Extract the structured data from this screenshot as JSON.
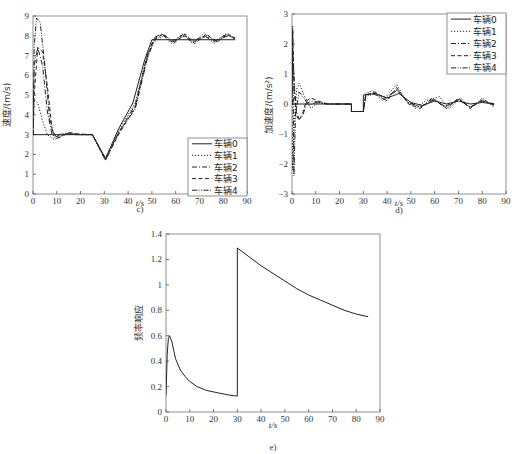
{
  "chart_data": [
    {
      "id": "c",
      "type": "line",
      "caption": "c)",
      "title": "",
      "xlabel": "t/s",
      "ylabel": "速度/(m/s)",
      "xlim": [
        0,
        90
      ],
      "ylim": [
        0,
        9
      ],
      "xticks": [
        0,
        10,
        20,
        30,
        40,
        50,
        60,
        70,
        80,
        90
      ],
      "yticks": [
        0,
        1,
        2,
        3,
        4,
        5,
        6,
        7,
        8,
        9
      ],
      "grid": false,
      "legend_position": "lower right",
      "legend": [
        "车辆0",
        "车辆1",
        "车辆2",
        "车辆3",
        "车辆4"
      ],
      "series": [
        {
          "name": "车辆0",
          "style": "solid",
          "points": [
            [
              0,
              3
            ],
            [
              25,
              3
            ],
            [
              30.5,
              1.8
            ],
            [
              36,
              3.3
            ],
            [
              42,
              4.6
            ],
            [
              47,
              6.8
            ],
            [
              50,
              7.8
            ],
            [
              85,
              7.8
            ]
          ]
        },
        {
          "name": "车辆1",
          "style": "dotted",
          "points": [
            [
              0,
              3
            ],
            [
              0.5,
              4.8
            ],
            [
              2,
              4.6
            ],
            [
              4,
              3.7
            ],
            [
              6,
              3.0
            ],
            [
              9,
              2.75
            ],
            [
              12,
              2.95
            ],
            [
              16,
              3.05
            ],
            [
              20,
              3
            ],
            [
              25,
              3
            ],
            [
              30.5,
              1.75
            ],
            [
              36,
              3.2
            ],
            [
              43,
              4.6
            ],
            [
              48,
              7.0
            ],
            [
              51,
              7.7
            ],
            [
              55,
              8.0
            ],
            [
              58,
              7.6
            ],
            [
              63,
              8.1
            ],
            [
              67,
              7.6
            ],
            [
              72,
              8.15
            ],
            [
              76,
              7.6
            ],
            [
              81,
              8.1
            ],
            [
              85,
              7.8
            ]
          ]
        },
        {
          "name": "车辆2",
          "style": "dashdot",
          "points": [
            [
              0,
              3
            ],
            [
              0.5,
              6.5
            ],
            [
              2,
              7.4
            ],
            [
              4,
              6.5
            ],
            [
              6,
              4.2
            ],
            [
              8,
              3.0
            ],
            [
              11,
              2.85
            ],
            [
              14,
              3.05
            ],
            [
              18,
              3
            ],
            [
              25,
              3
            ],
            [
              30.5,
              1.7
            ],
            [
              36,
              3.1
            ],
            [
              43,
              4.5
            ],
            [
              48,
              7.0
            ],
            [
              51,
              7.9
            ],
            [
              54,
              8.1
            ],
            [
              58,
              7.7
            ],
            [
              63,
              8.05
            ],
            [
              67,
              7.7
            ],
            [
              72,
              8.0
            ],
            [
              76,
              7.7
            ],
            [
              81,
              8.05
            ],
            [
              85,
              7.9
            ]
          ]
        },
        {
          "name": "车辆3",
          "style": "dashed",
          "points": [
            [
              0,
              3
            ],
            [
              0.5,
              5.0
            ],
            [
              2,
              7.4
            ],
            [
              4,
              7.2
            ],
            [
              6,
              5.5
            ],
            [
              8,
              3.3
            ],
            [
              10,
              2.8
            ],
            [
              13,
              3.0
            ],
            [
              17,
              3.05
            ],
            [
              25,
              3
            ],
            [
              30.5,
              1.75
            ],
            [
              36,
              3.0
            ],
            [
              43,
              4.4
            ],
            [
              48,
              6.9
            ],
            [
              51,
              7.85
            ],
            [
              55,
              8.1
            ],
            [
              59,
              7.6
            ],
            [
              64,
              8.1
            ],
            [
              68,
              7.6
            ],
            [
              73,
              8.1
            ],
            [
              77,
              7.65
            ],
            [
              82,
              8.1
            ],
            [
              85,
              7.85
            ]
          ]
        },
        {
          "name": "车辆4",
          "style": "dashdotdot",
          "points": [
            [
              0,
              3
            ],
            [
              0.5,
              7.5
            ],
            [
              1.5,
              8.9
            ],
            [
              3,
              8.7
            ],
            [
              5,
              6.5
            ],
            [
              7,
              3.8
            ],
            [
              9,
              2.85
            ],
            [
              12,
              3.05
            ],
            [
              16,
              3.1
            ],
            [
              20,
              3
            ],
            [
              25,
              3
            ],
            [
              30.5,
              1.7
            ],
            [
              36,
              3.1
            ],
            [
              43,
              4.3
            ],
            [
              48,
              6.8
            ],
            [
              51,
              7.8
            ],
            [
              55,
              8.05
            ],
            [
              59,
              7.7
            ],
            [
              64,
              8.0
            ],
            [
              68,
              7.7
            ],
            [
              73,
              8.0
            ],
            [
              77,
              7.75
            ],
            [
              82,
              8.0
            ],
            [
              85,
              7.9
            ]
          ]
        }
      ]
    },
    {
      "id": "d",
      "type": "line",
      "caption": "d)",
      "title": "",
      "xlabel": "t/s",
      "ylabel": "加速度/(m/s²)",
      "xlim": [
        0,
        90
      ],
      "ylim": [
        -3,
        3
      ],
      "xticks": [
        0,
        10,
        20,
        30,
        40,
        50,
        60,
        70,
        80,
        90
      ],
      "yticks": [
        -3,
        -2,
        -1,
        0,
        1,
        2,
        3
      ],
      "grid": false,
      "legend_position": "upper right",
      "legend": [
        "车辆0",
        "车辆1",
        "车辆2",
        "车辆3",
        "车辆4"
      ],
      "series": [
        {
          "name": "车辆0",
          "style": "solid",
          "points": [
            [
              0,
              0
            ],
            [
              25,
              0
            ],
            [
              25,
              -0.25
            ],
            [
              30,
              -0.25
            ],
            [
              30,
              0.3
            ],
            [
              35,
              0.35
            ],
            [
              40,
              0.2
            ],
            [
              45,
              0.35
            ],
            [
              50,
              0.05
            ],
            [
              55,
              -0.05
            ],
            [
              60,
              0.1
            ],
            [
              65,
              0
            ],
            [
              70,
              0.1
            ],
            [
              75,
              0
            ],
            [
              80,
              0.05
            ],
            [
              85,
              0
            ]
          ]
        },
        {
          "name": "车辆1",
          "style": "dotted",
          "points": [
            [
              0,
              0
            ],
            [
              0.3,
              -2.2
            ],
            [
              1,
              -0.5
            ],
            [
              2,
              0.5
            ],
            [
              3,
              0.7
            ],
            [
              5,
              0.3
            ],
            [
              8,
              -0.15
            ],
            [
              11,
              0.05
            ],
            [
              15,
              0
            ],
            [
              25,
              0
            ],
            [
              25,
              -0.25
            ],
            [
              30,
              -0.25
            ],
            [
              31,
              0.35
            ],
            [
              34,
              0.45
            ],
            [
              38,
              0.1
            ],
            [
              44,
              0.65
            ],
            [
              48,
              0.1
            ],
            [
              52,
              -0.15
            ],
            [
              56,
              0.1
            ],
            [
              62,
              0.25
            ],
            [
              66,
              -0.15
            ],
            [
              71,
              0.2
            ],
            [
              75,
              -0.15
            ],
            [
              80,
              0.2
            ],
            [
              85,
              -0.1
            ]
          ]
        },
        {
          "name": "车辆2",
          "style": "dashdot",
          "points": [
            [
              0,
              0
            ],
            [
              0.3,
              1.8
            ],
            [
              1,
              0.6
            ],
            [
              2,
              -0.3
            ],
            [
              3,
              -0.5
            ],
            [
              4.5,
              -0.4
            ],
            [
              6,
              0
            ],
            [
              8,
              0.1
            ],
            [
              12,
              0.05
            ],
            [
              15,
              0
            ],
            [
              25,
              0
            ],
            [
              25,
              -0.25
            ],
            [
              30,
              -0.25
            ],
            [
              31,
              0.3
            ],
            [
              34,
              0.35
            ],
            [
              39,
              0.15
            ],
            [
              44,
              0.5
            ],
            [
              49,
              0.05
            ],
            [
              54,
              -0.1
            ],
            [
              60,
              0.15
            ],
            [
              64,
              -0.1
            ],
            [
              70,
              0.15
            ],
            [
              75,
              -0.1
            ],
            [
              80,
              0.1
            ],
            [
              85,
              0
            ]
          ]
        },
        {
          "name": "车辆3",
          "style": "dashed",
          "points": [
            [
              0,
              0
            ],
            [
              0.3,
              2.4
            ],
            [
              1,
              0.3
            ],
            [
              2,
              -0.4
            ],
            [
              3,
              -0.55
            ],
            [
              4.5,
              -0.3
            ],
            [
              6,
              0.1
            ],
            [
              8,
              0.2
            ],
            [
              11,
              0.1
            ],
            [
              15,
              0
            ],
            [
              25,
              0
            ],
            [
              25,
              -0.25
            ],
            [
              30,
              -0.25
            ],
            [
              31,
              0.3
            ],
            [
              35,
              0.4
            ],
            [
              40,
              0.1
            ],
            [
              44,
              0.55
            ],
            [
              49,
              0.0
            ],
            [
              54,
              -0.15
            ],
            [
              59,
              0.2
            ],
            [
              65,
              -0.15
            ],
            [
              70,
              0.2
            ],
            [
              75,
              -0.15
            ],
            [
              80,
              0.15
            ],
            [
              85,
              -0.05
            ]
          ]
        },
        {
          "name": "车辆4",
          "style": "dashdotdot",
          "points": [
            [
              0,
              0
            ],
            [
              0.3,
              2.6
            ],
            [
              0.8,
              -2.4
            ],
            [
              1.5,
              -0.3
            ],
            [
              3,
              0.4
            ],
            [
              5,
              0.2
            ],
            [
              7,
              -0.05
            ],
            [
              10,
              0.05
            ],
            [
              15,
              0
            ],
            [
              25,
              0
            ],
            [
              25,
              -0.25
            ],
            [
              30,
              -0.25
            ],
            [
              31,
              0.25
            ],
            [
              35,
              0.35
            ],
            [
              40,
              0.2
            ],
            [
              44,
              0.45
            ],
            [
              49,
              0.05
            ],
            [
              54,
              -0.1
            ],
            [
              59,
              0.15
            ],
            [
              65,
              -0.1
            ],
            [
              70,
              0.15
            ],
            [
              75,
              -0.1
            ],
            [
              80,
              0.1
            ],
            [
              85,
              0
            ]
          ]
        }
      ]
    },
    {
      "id": "e",
      "type": "line",
      "caption": "e)",
      "title": "",
      "xlabel": "t/s",
      "ylabel": "频率响应",
      "xlim": [
        0,
        90
      ],
      "ylim": [
        0,
        1.4
      ],
      "xticks": [
        0,
        10,
        20,
        30,
        40,
        50,
        60,
        70,
        80,
        90
      ],
      "yticks": [
        0,
        0.2,
        0.4,
        0.6,
        0.8,
        1,
        1.2,
        1.4
      ],
      "ytick_labels": [
        "0",
        "0.2",
        "0.4",
        "0.6",
        "0.8",
        "1",
        "1.2",
        "1.4"
      ],
      "grid": false,
      "legend_position": "none",
      "series": [
        {
          "name": "频率响应",
          "style": "solid",
          "points": [
            [
              0,
              0.13
            ],
            [
              0.5,
              0.45
            ],
            [
              1,
              0.58
            ],
            [
              1.5,
              0.6
            ],
            [
              2.5,
              0.55
            ],
            [
              4,
              0.42
            ],
            [
              6,
              0.33
            ],
            [
              8,
              0.28
            ],
            [
              10,
              0.24
            ],
            [
              13,
              0.2
            ],
            [
              17,
              0.17
            ],
            [
              22,
              0.15
            ],
            [
              26,
              0.135
            ],
            [
              30,
              0.125
            ],
            [
              30,
              1.29
            ],
            [
              35,
              1.22
            ],
            [
              40,
              1.15
            ],
            [
              45,
              1.09
            ],
            [
              50,
              1.03
            ],
            [
              55,
              0.97
            ],
            [
              60,
              0.92
            ],
            [
              65,
              0.88
            ],
            [
              70,
              0.84
            ],
            [
              75,
              0.8
            ],
            [
              80,
              0.77
            ],
            [
              85,
              0.75
            ]
          ]
        }
      ]
    }
  ]
}
